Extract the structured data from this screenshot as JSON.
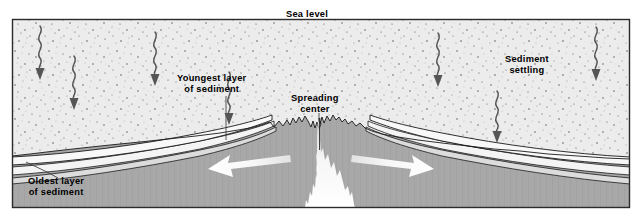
{
  "figure": {
    "kind": "geologic-cross-section",
    "frame": {
      "x": 12,
      "y": 19,
      "width": 618,
      "height": 189
    }
  },
  "labels": {
    "sea_level": "Sea level",
    "youngest_layer": "Youngest layer\nof sediment",
    "spreading_center": "Spreading\ncenter",
    "sediment_settling": "Sediment\nsettling",
    "oldest_layer": "Oldest layer\nof sediment"
  },
  "colors": {
    "water": "#ececec",
    "speckle": "#4a4a4a",
    "basement_rock": "#a8a8a8",
    "sediment_band_light": "#f4f4f4",
    "sediment_band_mid": "#cfcfcf",
    "magma_plume": "#fdfdfd",
    "outline": "#1a1a1a",
    "spreading_arrow": "#ffffff",
    "settling_arrow": "#555555",
    "frame": "#2b2b2b",
    "text": "#000000"
  },
  "elements": {
    "sea_level_line": {
      "style": "dashed",
      "y": 17
    },
    "spreading_arrows": [
      {
        "name": "left",
        "direction": "west",
        "tip_x": 208,
        "tip_y": 167
      },
      {
        "name": "right",
        "direction": "east",
        "tip_x": 434,
        "tip_y": 167
      }
    ],
    "settling_arrows": [
      {
        "x": 40,
        "y": 26
      },
      {
        "x": 74,
        "y": 56
      },
      {
        "x": 155,
        "y": 32
      },
      {
        "x": 229,
        "y": 72
      },
      {
        "x": 438,
        "y": 33
      },
      {
        "x": 497,
        "y": 91
      },
      {
        "x": 596,
        "y": 27
      }
    ],
    "leader_lines": [
      {
        "from": "youngest-label",
        "to": "sediment-layer-left"
      },
      {
        "from": "spreading-label",
        "to": "ridge-axis"
      },
      {
        "from": "oldest-label",
        "to": "basal-sediment-layer"
      }
    ]
  }
}
